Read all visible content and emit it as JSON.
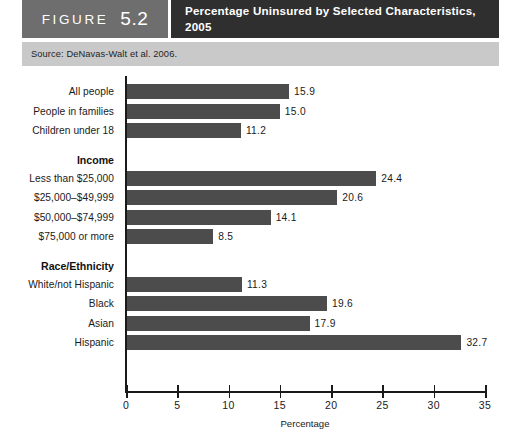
{
  "header": {
    "figure_word": "FIGURE",
    "figure_number": "5.2",
    "title": "Percentage Uninsured by Selected Characteristics, 2005"
  },
  "source": {
    "text": "Source: DeNavas-Walt et al. 2006."
  },
  "chart_data": {
    "type": "bar",
    "orientation": "horizontal",
    "title": "Percentage Uninsured by Selected Characteristics, 2005",
    "xlabel": "Percentage",
    "ylabel": "",
    "xlim": [
      0,
      35
    ],
    "xticks": [
      0,
      5,
      10,
      15,
      20,
      25,
      30,
      35
    ],
    "xticklabels": [
      "0",
      "5",
      "10",
      "15",
      "20",
      "25",
      "30",
      "35"
    ],
    "grid": false,
    "legend": false,
    "bar_color": "#4c4c4c",
    "groups": [
      {
        "name": "",
        "categories": [
          "All people",
          "People in families",
          "Children under 18"
        ],
        "values": [
          15.9,
          15.0,
          11.2
        ],
        "labels": [
          "15.9",
          "15.0",
          "11.2"
        ]
      },
      {
        "name": "Income",
        "categories": [
          "Less than $25,000",
          "$25,000–$49,999",
          "$50,000–$74,999",
          "$75,000 or more"
        ],
        "values": [
          24.4,
          20.6,
          14.1,
          8.5
        ],
        "labels": [
          "24.4",
          "20.6",
          "14.1",
          "8.5"
        ]
      },
      {
        "name": "Race/Ethnicity",
        "categories": [
          "White/not Hispanic",
          "Black",
          "Asian",
          "Hispanic"
        ],
        "values": [
          11.3,
          19.6,
          17.9,
          32.7
        ],
        "labels": [
          "11.3",
          "19.6",
          "17.9",
          "32.7"
        ]
      }
    ],
    "categories": [
      "All people",
      "People in families",
      "Children under 18",
      "Less than $25,000",
      "$25,000–$49,999",
      "$50,000–$74,999",
      "$75,000 or more",
      "White/not Hispanic",
      "Black",
      "Asian",
      "Hispanic"
    ],
    "values": [
      15.9,
      15.0,
      11.2,
      24.4,
      20.6,
      14.1,
      8.5,
      11.3,
      19.6,
      17.9,
      32.7
    ]
  }
}
